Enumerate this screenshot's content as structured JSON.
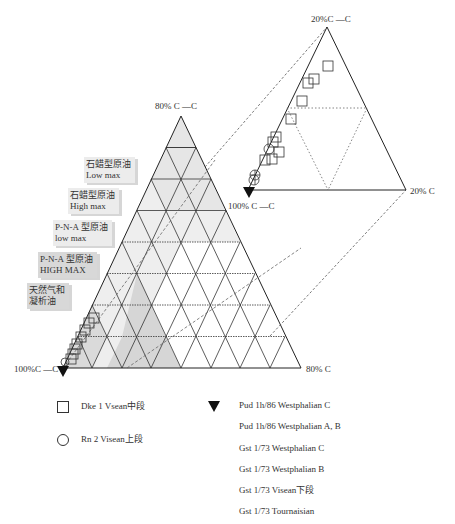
{
  "main_triangle": {
    "apex_label": "80% C —C",
    "left_label": "100%C —C",
    "right_label": "80% C",
    "divisions": 8
  },
  "inset_triangle": {
    "apex_label": "20%C —C",
    "left_label": "100% C —C",
    "right_label": "20% C"
  },
  "zones": [
    {
      "label_cn": "石蜡型原油",
      "label_en": "Low max"
    },
    {
      "label_cn": "石蜡型原油",
      "label_en": "High max"
    },
    {
      "label_cn": "P-N-A 型原油",
      "label_en": "low max"
    },
    {
      "label_cn": "P-N-A 型原油",
      "label_en": "HIGH MAX"
    },
    {
      "label_cn": "天然气和",
      "label_en": "凝析油"
    }
  ],
  "legend": {
    "left": [
      {
        "symbol": "square",
        "label": "Dke 1 Vsean中段"
      },
      {
        "symbol": "circle",
        "label": "Rn 2 Visean上段"
      }
    ],
    "right": [
      {
        "symbol": "filled-triangle",
        "label": "Pud 1h/86 Westphalian C"
      },
      {
        "symbol": "",
        "label": "Pud 1h/86 Westphalian A, B"
      },
      {
        "symbol": "",
        "label": "Gst 1/73 Westphalian C"
      },
      {
        "symbol": "",
        "label": "Gst 1/73 Westphalian B"
      },
      {
        "symbol": "",
        "label": "Gst 1/73 Visean下段"
      },
      {
        "symbol": "",
        "label": "Gst 1/73 Tournaisian"
      }
    ]
  },
  "colors": {
    "light_shade": "#ebebeb",
    "dark_shade": "#d4d4d4",
    "line": "#333333"
  }
}
